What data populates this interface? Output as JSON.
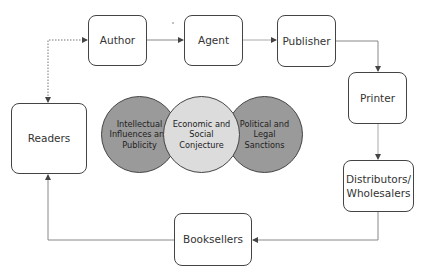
{
  "nodes": {
    "author": "Author",
    "agent": "Agent",
    "publisher": "Publisher",
    "printer": "Printer",
    "distributors_line1": "Distributors/",
    "distributors_line2": "Wholesalers",
    "booksellers": "Booksellers",
    "readers": "Readers"
  },
  "influences": [
    {
      "label": "Intellectual Influences and Publicity",
      "color": "#9a9a9a"
    },
    {
      "label": "Economic and Social Conjecture",
      "color": "#dcdcdc"
    },
    {
      "label": "Political and Legal Sanctions",
      "color": "#9a9a9a"
    }
  ],
  "colors": {
    "box_border": "#444444",
    "connector": "#888888",
    "dark_circle": "#9a9a9a",
    "light_circle": "#dcdcdc"
  }
}
